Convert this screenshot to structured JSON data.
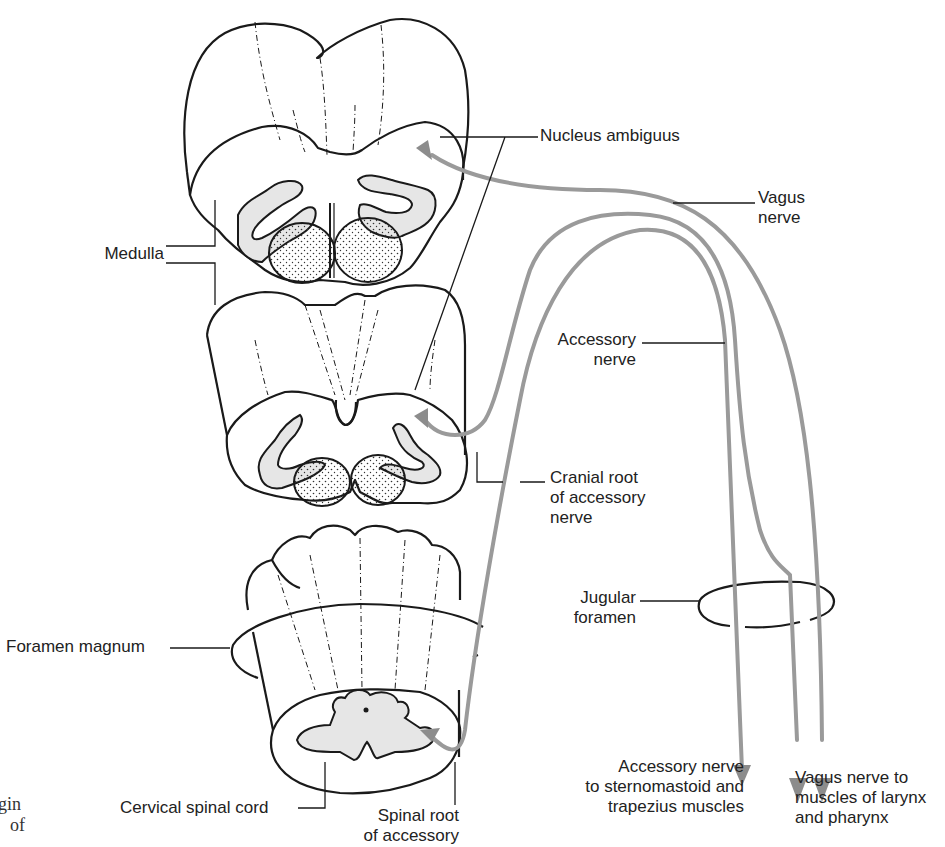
{
  "figure": {
    "type": "anatomical-diagram",
    "colors": {
      "outline": "#1a1a1a",
      "nerve": "#9a9a9a",
      "nucleus_fill": "#e6e6e6",
      "background": "#ffffff"
    }
  },
  "labels": {
    "nucleus_ambiguus": "Nucleus ambiguus",
    "vagus_nerve": "Vagus\nnerve",
    "medulla": "Medulla",
    "accessory_nerve": "Accessory\nnerve",
    "cranial_root": "Cranial root\nof accessory\nnerve",
    "jugular_foramen": "Jugular\nforamen",
    "foramen_magnum": "Foramen magnum",
    "accessory_to_muscles": "Accessory nerve\nto sternomastoid and\ntrapezius muscles",
    "vagus_to_muscles": "Vagus nerve to\nmuscles of larynx\nand pharynx",
    "cervical_spinal_cord": "Cervical spinal cord",
    "spinal_root": "Spinal root\nof accessory"
  },
  "caption_fragment": {
    "line1": "gin",
    "line2": "of"
  },
  "structures": [
    {
      "name": "upper-medulla-section",
      "label_ref": "medulla"
    },
    {
      "name": "lower-medulla-section",
      "label_ref": "medulla"
    },
    {
      "name": "cervical-spinal-cord-section",
      "label_ref": "cervical_spinal_cord"
    },
    {
      "name": "foramen-magnum-ring",
      "label_ref": "foramen_magnum"
    },
    {
      "name": "jugular-foramen-ring",
      "label_ref": "jugular_foramen"
    }
  ],
  "pathways": [
    {
      "name": "vagus-nerve-path",
      "from": "nucleus_ambiguus (upper medulla)",
      "to": "muscles of larynx and pharynx"
    },
    {
      "name": "cranial-root-path",
      "from": "nucleus ambiguus (lower medulla)",
      "to": "larynx and pharynx via vagus"
    },
    {
      "name": "spinal-root-path",
      "from": "cervical spinal cord",
      "to": "sternomastoid and trapezius muscles"
    }
  ]
}
